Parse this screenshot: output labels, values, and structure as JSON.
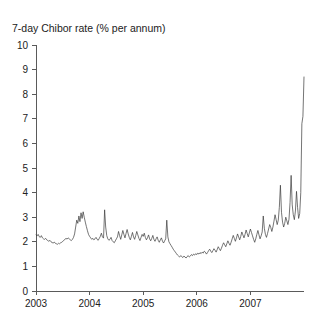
{
  "chart_data": {
    "type": "line",
    "title": "7-day Chibor rate (% per annum)",
    "xlabel": "",
    "ylabel": "",
    "ylim": [
      0,
      10
    ],
    "xlim": [
      2003.0,
      2008.0
    ],
    "yticks": [
      0,
      1,
      2,
      3,
      4,
      5,
      6,
      7,
      8,
      9,
      10
    ],
    "xticks": [
      2003,
      2004,
      2005,
      2006,
      2007
    ],
    "xtick_labels": [
      "2003",
      "2004",
      "2005",
      "2006",
      "2007"
    ],
    "ytick_labels": [
      "0",
      "1",
      "2",
      "3",
      "4",
      "5",
      "6",
      "7",
      "8",
      "9",
      "10"
    ],
    "grid": false,
    "legend": false,
    "line_color": "#3a3a3a",
    "axis_color": "#5a5a5a",
    "series": [
      {
        "name": "7-day Chibor rate",
        "x": [
          2003.0,
          2003.02,
          2003.04,
          2003.06,
          2003.08,
          2003.1,
          2003.12,
          2003.14,
          2003.16,
          2003.18,
          2003.2,
          2003.22,
          2003.24,
          2003.26,
          2003.28,
          2003.3,
          2003.32,
          2003.34,
          2003.36,
          2003.38,
          2003.4,
          2003.42,
          2003.44,
          2003.46,
          2003.48,
          2003.5,
          2003.52,
          2003.54,
          2003.56,
          2003.58,
          2003.6,
          2003.62,
          2003.64,
          2003.66,
          2003.68,
          2003.7,
          2003.72,
          2003.74,
          2003.76,
          2003.78,
          2003.8,
          2003.82,
          2003.84,
          2003.86,
          2003.88,
          2003.9,
          2003.92,
          2003.94,
          2003.96,
          2003.98,
          2004.0,
          2004.02,
          2004.04,
          2004.06,
          2004.08,
          2004.1,
          2004.12,
          2004.14,
          2004.16,
          2004.18,
          2004.2,
          2004.22,
          2004.24,
          2004.26,
          2004.28,
          2004.3,
          2004.32,
          2004.34,
          2004.36,
          2004.38,
          2004.4,
          2004.42,
          2004.44,
          2004.46,
          2004.48,
          2004.5,
          2004.52,
          2004.54,
          2004.56,
          2004.58,
          2004.6,
          2004.62,
          2004.64,
          2004.66,
          2004.68,
          2004.7,
          2004.72,
          2004.74,
          2004.76,
          2004.78,
          2004.8,
          2004.82,
          2004.84,
          2004.86,
          2004.88,
          2004.9,
          2004.92,
          2004.94,
          2004.96,
          2004.98,
          2005.0,
          2005.02,
          2005.04,
          2005.06,
          2005.08,
          2005.1,
          2005.12,
          2005.14,
          2005.16,
          2005.18,
          2005.2,
          2005.22,
          2005.24,
          2005.26,
          2005.28,
          2005.3,
          2005.32,
          2005.34,
          2005.36,
          2005.38,
          2005.4,
          2005.42,
          2005.44,
          2005.46,
          2005.48,
          2005.5,
          2005.52,
          2005.54,
          2005.56,
          2005.58,
          2005.6,
          2005.62,
          2005.64,
          2005.66,
          2005.68,
          2005.7,
          2005.72,
          2005.74,
          2005.76,
          2005.78,
          2005.8,
          2005.82,
          2005.84,
          2005.86,
          2005.88,
          2005.9,
          2005.92,
          2005.94,
          2005.96,
          2005.98,
          2006.0,
          2006.02,
          2006.04,
          2006.06,
          2006.08,
          2006.1,
          2006.12,
          2006.14,
          2006.16,
          2006.18,
          2006.2,
          2006.22,
          2006.24,
          2006.26,
          2006.28,
          2006.3,
          2006.32,
          2006.34,
          2006.36,
          2006.38,
          2006.4,
          2006.42,
          2006.44,
          2006.46,
          2006.48,
          2006.5,
          2006.52,
          2006.54,
          2006.56,
          2006.58,
          2006.6,
          2006.62,
          2006.64,
          2006.66,
          2006.68,
          2006.7,
          2006.72,
          2006.74,
          2006.76,
          2006.78,
          2006.8,
          2006.82,
          2006.84,
          2006.86,
          2006.88,
          2006.9,
          2006.92,
          2006.94,
          2006.96,
          2006.98,
          2007.0,
          2007.02,
          2007.04,
          2007.06,
          2007.08,
          2007.1,
          2007.12,
          2007.14,
          2007.16,
          2007.18,
          2007.2,
          2007.22,
          2007.24,
          2007.26,
          2007.28,
          2007.3,
          2007.32,
          2007.34,
          2007.36,
          2007.38,
          2007.4,
          2007.42,
          2007.44,
          2007.46,
          2007.48,
          2007.5,
          2007.52,
          2007.54,
          2007.56,
          2007.58,
          2007.6,
          2007.62,
          2007.64,
          2007.66,
          2007.68,
          2007.7,
          2007.72,
          2007.74,
          2007.76,
          2007.78,
          2007.8,
          2007.82,
          2007.84,
          2007.86,
          2007.88,
          2007.9,
          2007.92,
          2007.94,
          2007.96,
          2007.98,
          2008.0
        ],
        "values": [
          2.28,
          2.24,
          2.3,
          2.21,
          2.18,
          2.25,
          2.16,
          2.12,
          2.1,
          2.14,
          2.08,
          2.05,
          2.02,
          2.06,
          2.0,
          1.97,
          1.95,
          1.99,
          1.94,
          1.92,
          1.9,
          1.94,
          1.92,
          1.96,
          1.98,
          2.02,
          2.06,
          2.1,
          2.14,
          2.11,
          2.16,
          2.12,
          2.08,
          2.05,
          2.1,
          2.18,
          2.32,
          2.6,
          2.88,
          2.75,
          3.05,
          2.82,
          3.18,
          2.95,
          3.22,
          3.0,
          2.8,
          2.62,
          2.45,
          2.3,
          2.22,
          2.16,
          2.1,
          2.14,
          2.08,
          2.12,
          2.18,
          2.1,
          2.06,
          2.14,
          2.22,
          2.35,
          2.2,
          2.15,
          3.3,
          2.6,
          2.25,
          2.12,
          2.06,
          2.1,
          2.18,
          2.05,
          2.0,
          1.96,
          2.04,
          2.12,
          2.2,
          2.42,
          2.25,
          2.1,
          2.28,
          2.46,
          2.3,
          2.16,
          2.34,
          2.5,
          2.32,
          2.18,
          2.08,
          2.22,
          2.38,
          2.2,
          2.1,
          2.25,
          2.42,
          2.28,
          2.14,
          2.05,
          2.18,
          2.3,
          2.22,
          2.35,
          2.18,
          2.08,
          2.16,
          2.28,
          2.12,
          2.04,
          2.14,
          2.26,
          2.1,
          2.02,
          2.12,
          2.2,
          2.06,
          1.98,
          2.08,
          2.16,
          2.02,
          1.95,
          2.04,
          2.12,
          2.88,
          2.2,
          2.0,
          1.92,
          1.85,
          1.78,
          1.7,
          1.64,
          1.58,
          1.52,
          1.46,
          1.42,
          1.38,
          1.44,
          1.4,
          1.36,
          1.42,
          1.38,
          1.34,
          1.4,
          1.44,
          1.38,
          1.42,
          1.48,
          1.44,
          1.5,
          1.46,
          1.52,
          1.48,
          1.54,
          1.5,
          1.56,
          1.52,
          1.58,
          1.54,
          1.62,
          1.58,
          1.5,
          1.56,
          1.64,
          1.7,
          1.62,
          1.56,
          1.64,
          1.72,
          1.66,
          1.58,
          1.68,
          1.8,
          1.72,
          1.64,
          1.74,
          1.86,
          1.96,
          1.88,
          1.8,
          1.92,
          2.04,
          1.94,
          1.86,
          1.98,
          2.12,
          2.26,
          2.14,
          2.02,
          2.16,
          2.32,
          2.2,
          2.08,
          2.22,
          2.4,
          2.28,
          2.16,
          2.3,
          2.48,
          2.34,
          2.2,
          2.36,
          2.52,
          2.38,
          2.24,
          2.1,
          1.98,
          2.12,
          2.3,
          2.46,
          2.28,
          2.12,
          2.24,
          2.4,
          3.05,
          2.55,
          2.3,
          2.18,
          2.34,
          2.52,
          2.7,
          2.58,
          2.42,
          2.6,
          2.84,
          3.1,
          2.9,
          2.7,
          2.88,
          3.4,
          4.3,
          3.2,
          2.8,
          2.6,
          2.75,
          3.0,
          2.85,
          2.7,
          2.92,
          3.6,
          4.7,
          3.5,
          3.1,
          2.9,
          3.25,
          4.05,
          3.4,
          2.95,
          3.15,
          4.0,
          6.8,
          7.1,
          8.7
        ]
      }
    ],
    "annotations": []
  }
}
